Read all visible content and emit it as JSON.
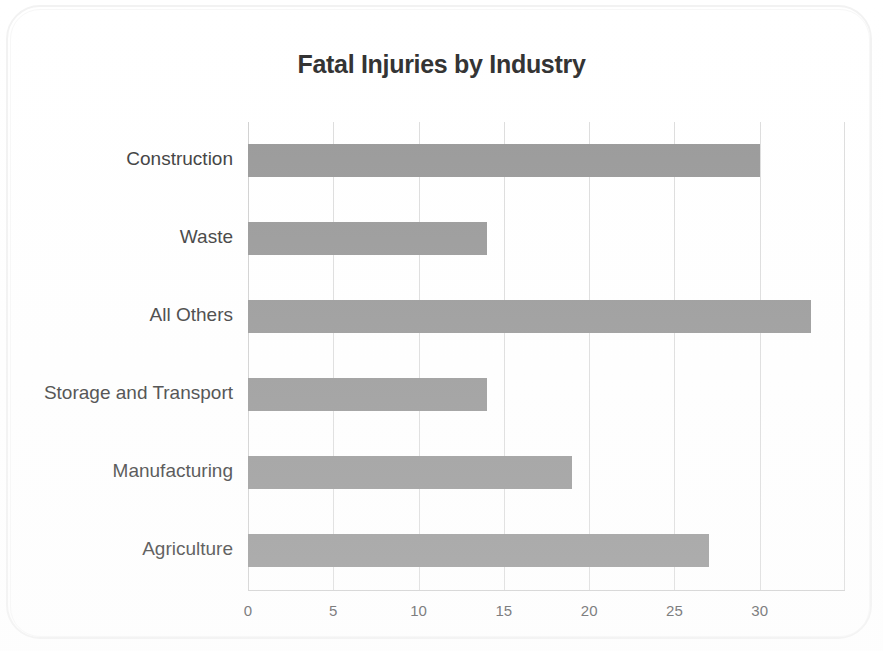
{
  "chart_data": {
    "type": "bar",
    "orientation": "horizontal",
    "title": "Fatal Injuries by Industry",
    "xlabel": "",
    "ylabel": "",
    "categories": [
      "Construction",
      "Waste",
      "All Others",
      "Storage and Transport",
      "Manufacturing",
      "Agriculture"
    ],
    "values": [
      30,
      14,
      33,
      14,
      19,
      27
    ],
    "series": [
      {
        "name": "Fatal Injuries",
        "values": [
          30,
          14,
          33,
          14,
          19,
          27
        ]
      }
    ],
    "xticks": [
      0,
      5,
      10,
      15,
      20,
      25,
      30
    ],
    "xtick_labels": [
      "0",
      "5",
      "10",
      "15",
      "20",
      "25",
      "30"
    ],
    "xlim": [
      0,
      35
    ],
    "grid": "vertical",
    "legend": "none",
    "bar_color": "#979797",
    "gridline_color": "#dcdcdc",
    "title_color": "#2f2f2f",
    "label_color": "#3a3a3a",
    "tick_color": "#58585a",
    "background_color": "#ffffff"
  }
}
